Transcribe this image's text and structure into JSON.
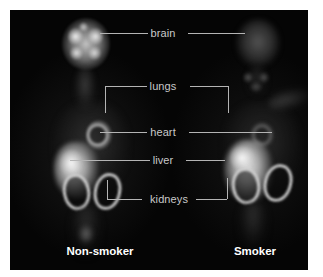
{
  "figure": {
    "modality": "PET scan",
    "background_color": "#ffffff",
    "panel_color": "#050505",
    "label_color": "#c9c9c9",
    "caption_color": "#ffffff"
  },
  "annotations": [
    {
      "id": "brain",
      "label": "brain",
      "style": "line",
      "label_x": 163,
      "label_y": 33
    },
    {
      "id": "lungs",
      "label": "lungs",
      "style": "bracket-down",
      "label_x": 163,
      "label_y": 86
    },
    {
      "id": "heart",
      "label": "heart",
      "style": "line",
      "label_x": 163,
      "label_y": 132
    },
    {
      "id": "liver",
      "label": "liver",
      "style": "line",
      "label_x": 163,
      "label_y": 160
    },
    {
      "id": "kidneys",
      "label": "kidneys",
      "style": "bracket-up",
      "label_x": 163,
      "label_y": 199
    }
  ],
  "subjects": [
    {
      "id": "non-smoker",
      "caption": "Non-smoker",
      "caption_x": 100,
      "caption_y": 252
    },
    {
      "id": "smoker",
      "caption": "Smoker",
      "caption_x": 255,
      "caption_y": 252
    }
  ]
}
